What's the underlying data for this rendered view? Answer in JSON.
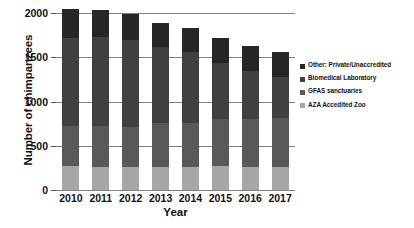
{
  "chart_data": {
    "type": "bar",
    "subtype": "stacked-bar",
    "title": "",
    "xlabel": "Year",
    "ylabel": "Number of chimpanzees",
    "categories": [
      "2010",
      "2011",
      "2012",
      "2013",
      "2014",
      "2015",
      "2016",
      "2017"
    ],
    "ylim": [
      0,
      2000
    ],
    "yticks": [
      0,
      500,
      1000,
      1500,
      2000
    ],
    "ytick_labels": [
      "0",
      "500",
      "1000",
      "1500",
      "2000"
    ],
    "grid": true,
    "legend_position": "right",
    "series": [
      {
        "name": "AZA Accedited Zoo",
        "color": "#a6a6a6",
        "values": [
          270,
          265,
          260,
          258,
          255,
          272,
          262,
          255
        ]
      },
      {
        "name": "GFAS sanctuaries",
        "color": "#595959",
        "values": [
          455,
          455,
          455,
          500,
          500,
          530,
          545,
          555
        ]
      },
      {
        "name": "Biomedical Laboratory",
        "color": "#404040",
        "values": [
          990,
          1005,
          975,
          855,
          800,
          630,
          535,
          470
        ]
      },
      {
        "name": "Other: Private/Unaccredited",
        "color": "#262626",
        "values": [
          330,
          305,
          295,
          270,
          280,
          290,
          285,
          275
        ]
      }
    ],
    "totals": [
      2045,
      2030,
      1985,
      1883,
      1835,
      1722,
      1627,
      1555
    ]
  },
  "axes": {
    "y_title": "Number of chimpanzees",
    "x_title": "Year"
  },
  "legend": {
    "items": [
      {
        "label": "Other: Private/Unaccredited",
        "color": "#262626"
      },
      {
        "label": "Biomedical Laboratory",
        "color": "#404040"
      },
      {
        "label": "GFAS sanctuaries",
        "color": "#595959"
      },
      {
        "label": "AZA Accedited Zoo",
        "color": "#a6a6a6"
      }
    ]
  },
  "colors": {
    "gridline": "#808080",
    "text": "#111111",
    "background": "#ffffff"
  }
}
